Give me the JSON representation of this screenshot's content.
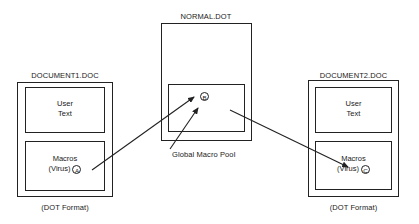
{
  "diagram": {
    "nodes": {
      "document1": {
        "title": "DOCUMENT1.DOC",
        "user_text_line1": "User",
        "user_text_line2": "Text",
        "macros_line1": "Macros",
        "macros_line2": "(Virus)",
        "marker": "A",
        "format": "(DOT Format)"
      },
      "normal_dot": {
        "title": "NORMAL.DOT",
        "marker": "B",
        "pool_label": "Global Macro Pool"
      },
      "document2": {
        "title": "DOCUMENT2.DOC",
        "user_text_line1": "User",
        "user_text_line2": "Text",
        "macros_line1": "Macros",
        "macros_line2": "(Virus)",
        "marker": "C",
        "format": "(DOT Format)"
      }
    },
    "edges": [
      {
        "from": "document1.macros (A)",
        "to": "normal_dot.pool (B)"
      },
      {
        "from": "normal_dot.pool (B)",
        "to": "document2.macros (C)"
      },
      {
        "from": "Global Macro Pool label",
        "to": "normal_dot.pool"
      }
    ],
    "colors": {
      "stroke": "#222222",
      "background": "#ffffff"
    }
  }
}
